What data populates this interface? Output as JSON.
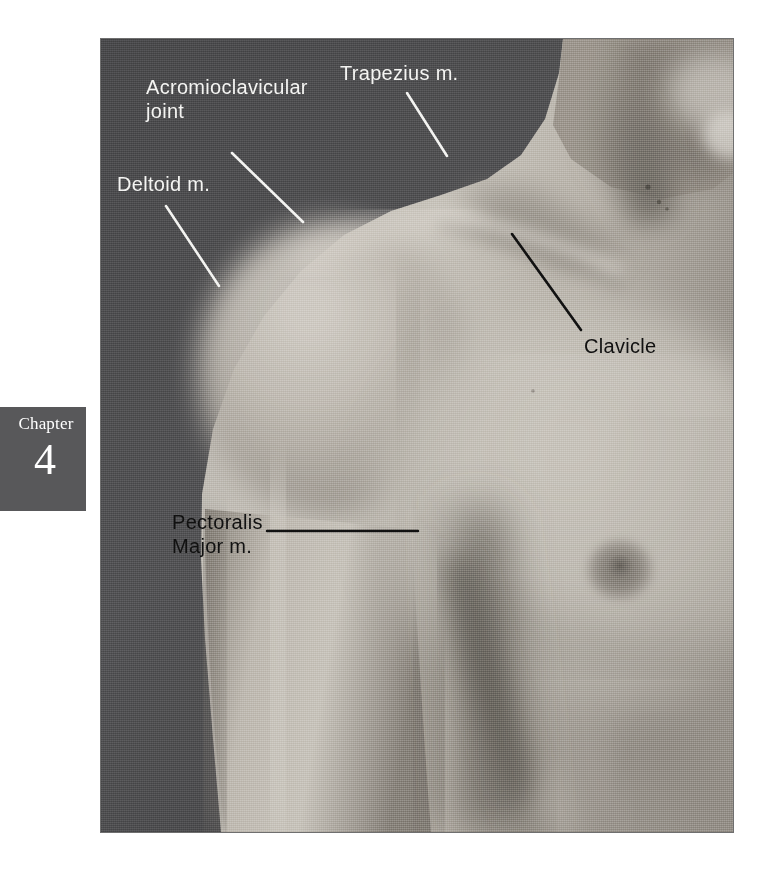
{
  "figure": {
    "type": "anatomy-photograph",
    "plate": {
      "left": 101,
      "top": 39,
      "width": 632,
      "height": 793
    },
    "background_tone": "#58585a",
    "skin_tone": "#b9b4ad"
  },
  "chapter_tab": {
    "word": "Chapter",
    "number": "4",
    "background": "#58585a",
    "text_color": "#ffffff"
  },
  "labels": [
    {
      "id": "acromioclavicular-joint",
      "text": "Acromioclavicular\njoint",
      "color": "white",
      "color_hex": "#f4f4f2",
      "text_x": 146,
      "text_y": 76,
      "leader": {
        "x1": 232,
        "y1": 153,
        "x2": 303,
        "y2": 222
      }
    },
    {
      "id": "trapezius",
      "text": "Trapezius m.",
      "color": "white",
      "color_hex": "#f4f4f2",
      "text_x": 340,
      "text_y": 62,
      "leader": {
        "x1": 407,
        "y1": 93,
        "x2": 447,
        "y2": 156
      }
    },
    {
      "id": "deltoid",
      "text": "Deltoid m.",
      "color": "white",
      "color_hex": "#f4f4f2",
      "text_x": 117,
      "text_y": 173,
      "leader": {
        "x1": 166,
        "y1": 206,
        "x2": 219,
        "y2": 286
      }
    },
    {
      "id": "clavicle",
      "text": "Clavicle",
      "color": "black",
      "color_hex": "#111111",
      "text_x": 584,
      "text_y": 335,
      "leader": {
        "x1": 512,
        "y1": 234,
        "x2": 581,
        "y2": 330
      }
    },
    {
      "id": "pectoralis-major",
      "text": "Pectoralis\nMajor m.",
      "color": "black",
      "color_hex": "#111111",
      "text_x": 172,
      "text_y": 511,
      "leader": {
        "x1": 267,
        "y1": 531,
        "x2": 418,
        "y2": 531
      }
    }
  ]
}
